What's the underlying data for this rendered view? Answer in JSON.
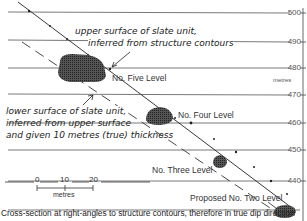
{
  "diagram": {
    "axis": {
      "unit_label": "metres",
      "ticks": [
        "500",
        "490",
        "480",
        "470",
        "460",
        "450",
        "440"
      ]
    },
    "annotations": {
      "upper_line1": "upper surface of slate unit,",
      "upper_line2": "inferred from structure contours",
      "lower_line1": "lower surface of slate unit,",
      "lower_line2": "inferred from upper surface",
      "lower_line3": "and given 10 metres (true) thickness"
    },
    "levels": {
      "five": "No. Five Level",
      "four": "No. Four Level",
      "three": "No. Three Level",
      "two": "Proposed No. Two Level"
    },
    "scale": {
      "t0": "0",
      "t10": "10",
      "t20": "20",
      "unit": "metres"
    },
    "caption": "Cross-section at right-angles to structure contours, therefore in true dip direction"
  }
}
